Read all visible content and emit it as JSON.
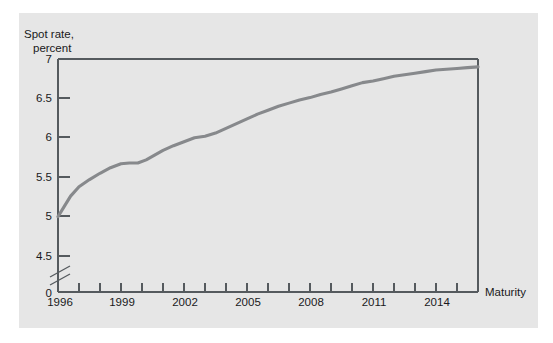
{
  "figure": {
    "background_color": "#e6e6e6",
    "page_background_color": "#ffffff",
    "frame_color": "#555a5e"
  },
  "labels": {
    "y_axis_title_line1": "Spot rate,",
    "y_axis_title_line2": "percent",
    "x_axis_title": "Maturity"
  },
  "axis": {
    "y_tick_labels": [
      "0",
      "4.5",
      "5",
      "5.5",
      "6",
      "6.5",
      "7"
    ],
    "x_tick_labels": [
      "1996",
      "1999",
      "2002",
      "2005",
      "2008",
      "2011",
      "2014"
    ],
    "y_break_present": true
  },
  "chart_data": {
    "type": "line",
    "title": "",
    "subtitle": "",
    "xlabel": "Maturity",
    "ylabel": "Spot rate, percent",
    "xlim": [
      1996,
      2016
    ],
    "ylim": [
      4.5,
      7.0
    ],
    "y_axis_break": {
      "from": 0,
      "to": 4.5
    },
    "yticks": [
      4.5,
      5,
      5.5,
      6,
      6.5,
      7
    ],
    "ytick_labels": [
      "4.5",
      "5",
      "5.5",
      "6",
      "6.5",
      "7"
    ],
    "xticks": [
      1996,
      1997,
      1998,
      1999,
      2000,
      2001,
      2002,
      2003,
      2004,
      2005,
      2006,
      2007,
      2008,
      2009,
      2010,
      2011,
      2012,
      2013,
      2014,
      2015,
      2016
    ],
    "xtick_labels_shown": [
      "1996",
      "1999",
      "2002",
      "2005",
      "2008",
      "2011",
      "2014"
    ],
    "grid": false,
    "legend": null,
    "legend_position": "none",
    "series": [
      {
        "name": "Spot rate curve",
        "color": "#87898c",
        "x": [
          1996,
          1996.3,
          1996.6,
          1997,
          1997.5,
          1998,
          1998.5,
          1999,
          1999.4,
          1999.8,
          2000.2,
          2000.6,
          2001,
          2001.5,
          2002,
          2002.5,
          2003,
          2003.5,
          2004,
          2004.5,
          2005,
          2005.5,
          2006,
          2006.5,
          2007,
          2007.5,
          2008,
          2008.5,
          2009,
          2009.5,
          2010,
          2010.5,
          2011,
          2011.5,
          2012,
          2012.5,
          2013,
          2013.5,
          2014,
          2014.5,
          2015,
          2015.5,
          2016
        ],
        "y": [
          5.0,
          5.13,
          5.26,
          5.38,
          5.47,
          5.55,
          5.62,
          5.67,
          5.68,
          5.68,
          5.72,
          5.78,
          5.84,
          5.9,
          5.95,
          6.0,
          6.02,
          6.06,
          6.12,
          6.18,
          6.24,
          6.3,
          6.35,
          6.4,
          6.44,
          6.48,
          6.51,
          6.55,
          6.58,
          6.62,
          6.66,
          6.7,
          6.72,
          6.75,
          6.78,
          6.8,
          6.82,
          6.84,
          6.86,
          6.87,
          6.88,
          6.89,
          6.9
        ]
      }
    ]
  }
}
